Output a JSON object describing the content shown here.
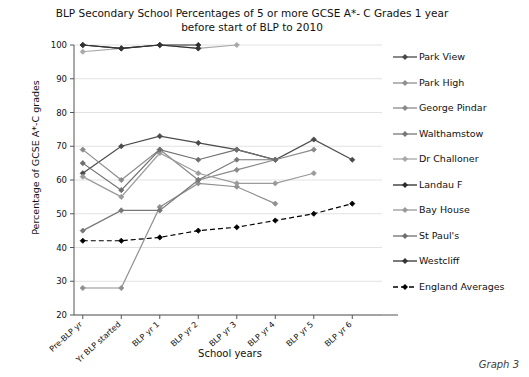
{
  "caption": "Graph 3",
  "chart_data": {
    "type": "line",
    "title": "BLP Secondary School Percentages of 5 or more GCSE A*- C Grades 1 year before start of BLP to 2010",
    "title_lines": [
      "BLP Secondary School Percentages of 5 or more GCSE A*- C Grades 1 year",
      "before start of BLP to 2010"
    ],
    "xlabel": "School years",
    "ylabel": "Percentage of GCSE A*-C grades",
    "ylim": [
      20,
      100
    ],
    "yticks": [
      20,
      30,
      40,
      50,
      60,
      70,
      80,
      90,
      100
    ],
    "grid": true,
    "legend_position": "right",
    "categories": [
      "Pre-BLP yr",
      "Yr BLP started",
      "BLP yr 1",
      "BLP yr 2",
      "BLP yr 3",
      "BLP yr 4",
      "BLP yr 5",
      "BLP yr 6"
    ],
    "series": [
      {
        "name": "Park View",
        "color": "#4a4a4a",
        "dash": "none",
        "values": [
          62,
          70,
          73,
          71,
          69,
          66,
          72,
          66
        ]
      },
      {
        "name": "Park High",
        "color": "#8f8f8f",
        "dash": "none",
        "values": [
          28,
          28,
          52,
          59,
          58,
          53,
          null,
          null
        ]
      },
      {
        "name": "George Pindar",
        "color": "#8a8a8a",
        "dash": "none",
        "values": [
          69,
          60,
          69,
          60,
          63,
          66,
          69,
          null
        ]
      },
      {
        "name": "Walthamstow",
        "color": "#777777",
        "dash": "none",
        "values": [
          45,
          51,
          51,
          60,
          66,
          66,
          null,
          null
        ]
      },
      {
        "name": "Dr Challoner",
        "color": "#a8a8a8",
        "dash": "none",
        "values": [
          98,
          99,
          100,
          99,
          100,
          null,
          null,
          null
        ]
      },
      {
        "name": "Landau F",
        "color": "#2b2b2b",
        "dash": "none",
        "values": [
          100,
          99,
          100,
          100,
          null,
          null,
          null,
          null
        ]
      },
      {
        "name": "Bay House",
        "color": "#9a9a9a",
        "dash": "none",
        "values": [
          61,
          55,
          68,
          62,
          59,
          59,
          62,
          null
        ]
      },
      {
        "name": "St Paul's",
        "color": "#6e6e6e",
        "dash": "none",
        "values": [
          65,
          57,
          69,
          66,
          69,
          66,
          null,
          null
        ]
      },
      {
        "name": "Westcliff",
        "color": "#333333",
        "dash": "none",
        "values": [
          100,
          99,
          100,
          99,
          null,
          null,
          null,
          null
        ]
      },
      {
        "name": "England Averages",
        "color": "#000000",
        "dash": "dashed",
        "values": [
          42,
          42,
          43,
          45,
          46,
          48,
          50,
          53
        ]
      }
    ]
  }
}
